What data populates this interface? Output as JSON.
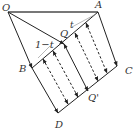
{
  "figure": {
    "colors": {
      "stroke": "#222222",
      "top_line": "#777777",
      "label": "#333333",
      "background": "#ffffff"
    },
    "points": {
      "O": {
        "label": "O",
        "x": 8,
        "y": 12
      },
      "A": {
        "label": "A",
        "x": 98,
        "y": 12
      },
      "B": {
        "label": "B",
        "x": 32,
        "y": 68
      },
      "Q": {
        "label": "Q",
        "x": 64,
        "y": 44
      },
      "C": {
        "label": "C",
        "x": 117,
        "y": 66
      },
      "D": {
        "label": "D",
        "x": 58,
        "y": 113
      },
      "Qp": {
        "label": "Q'",
        "x": 88,
        "y": 91
      }
    },
    "segment_labels": {
      "t": "t",
      "one_minus_t": "1−t"
    }
  }
}
